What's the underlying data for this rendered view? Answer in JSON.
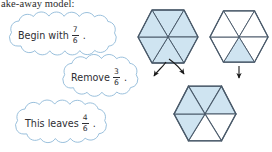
{
  "page": {
    "header_text": "ake-away model:",
    "background": "#ffffff"
  },
  "colors": {
    "shade_fill": "#cfe4f1",
    "hex_stroke": "#4a5a6a",
    "cloud_stroke": "#8fb9d8",
    "text": "#2e2e33",
    "arrow": "#1a1a1a"
  },
  "clouds": [
    {
      "id": "cloud-begin",
      "label": "Begin with",
      "fraction": {
        "numerator": "7",
        "denominator": "6"
      },
      "punctuation": "."
    },
    {
      "id": "cloud-remove",
      "label": "Remove",
      "fraction": {
        "numerator": "3",
        "denominator": "6"
      },
      "punctuation": "."
    },
    {
      "id": "cloud-leaves",
      "label": "This leaves",
      "fraction": {
        "numerator": "4",
        "denominator": "6"
      },
      "punctuation": "."
    }
  ],
  "diagram": {
    "shape": "hexagon",
    "parts_total": 6,
    "hexagons": [
      {
        "id": "hexagon-begin",
        "role": "begin",
        "shaded_parts": 6,
        "fraction_label": "7/6",
        "shaded_slices": [
          0,
          1,
          2,
          3,
          4,
          5
        ]
      },
      {
        "id": "hexagon-remove",
        "role": "remove",
        "shaded_parts": 1,
        "fraction_label": "3/6",
        "shaded_slices": [
          3
        ]
      },
      {
        "id": "hexagon-result",
        "role": "result",
        "shaded_parts": 4,
        "fraction_label": "4/6",
        "shaded_slices": [
          0,
          1,
          2,
          3
        ]
      }
    ],
    "arrows": [
      {
        "id": "arrow-left-curve",
        "type": "curved"
      },
      {
        "id": "arrow-right-curve",
        "type": "curved"
      },
      {
        "id": "arrow-down-straight",
        "type": "straight"
      }
    ]
  }
}
